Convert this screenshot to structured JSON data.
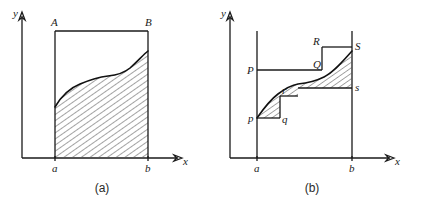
{
  "figure": {
    "type": "math-diagram",
    "background_color": "#ffffff",
    "ink_color": "#1a1a1a",
    "hatch_color": "#555555"
  },
  "panel_a": {
    "caption": "(a)",
    "axis": {
      "y_label": "y",
      "x_label": "x"
    },
    "tick_labels": {
      "left": "a",
      "right": "b"
    },
    "corner_labels": {
      "top_left": "A",
      "top_right": "B"
    },
    "regions": [
      {
        "name": "hatched-area-under-curve",
        "hatched": true,
        "bounded_by": [
          "curve",
          "x-axis",
          "x = a",
          "x = b"
        ]
      },
      {
        "name": "bounding-rectangle",
        "hatched": false,
        "corners": [
          "A",
          "B",
          "b",
          "a"
        ]
      }
    ]
  },
  "panel_b": {
    "caption": "(b)",
    "axis": {
      "y_label": "y",
      "x_label": "x"
    },
    "tick_labels": {
      "left": "a",
      "right": "b"
    },
    "upper_step_labels": {
      "left": "P",
      "mid": "Q",
      "upper_mid": "R",
      "right": "S"
    },
    "lower_step_labels": {
      "left": "p",
      "mid": "q",
      "upper_mid": "r",
      "right": "s"
    },
    "regions": [
      {
        "name": "lower-hatched-region",
        "hatched": true,
        "bounded_by": [
          "curve",
          "lower step p-q-r-s"
        ]
      },
      {
        "name": "upper-hatched-region",
        "hatched": true,
        "bounded_by": [
          "curve",
          "upper step P-Q-R-S"
        ]
      }
    ]
  }
}
